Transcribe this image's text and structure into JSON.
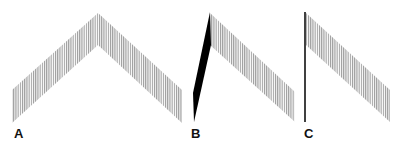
{
  "figure": {
    "panels": [
      {
        "label": "A",
        "shape": "chevron",
        "description": "Hatched inverted-V band with symmetric arms",
        "hatch_color": "#9a9a9a",
        "outline": [
          [
            12,
            90
          ],
          [
            98,
            13
          ],
          [
            182,
            90
          ],
          [
            182,
            123
          ],
          [
            98,
            45
          ],
          [
            12,
            123
          ]
        ]
      },
      {
        "label": "B",
        "shape": "chevron-with-collapsed-left-arm",
        "description": "Left arm compressed into a solid black sliver; right arm hatched",
        "hatch_color": "#9a9a9a",
        "solid_color": "#000000",
        "solid_outline": [
          [
            193,
            93
          ],
          [
            210,
            12
          ],
          [
            211,
            45
          ],
          [
            194,
            122
          ]
        ],
        "outline": [
          [
            210,
            13
          ],
          [
            295,
            92
          ],
          [
            295,
            122
          ],
          [
            210,
            45
          ]
        ]
      },
      {
        "label": "C",
        "shape": "single-arm",
        "description": "Left arm reduced to a vertical line; right arm hatched",
        "hatch_color": "#9a9a9a",
        "line_color": "#000000",
        "line": [
          [
            305,
            12
          ],
          [
            305,
            122
          ]
        ],
        "outline": [
          [
            306,
            13
          ],
          [
            390,
            90
          ],
          [
            390,
            122
          ],
          [
            306,
            45
          ]
        ]
      }
    ]
  }
}
